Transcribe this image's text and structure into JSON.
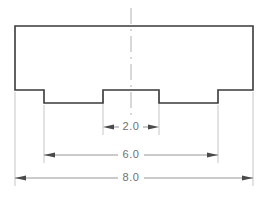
{
  "drawing": {
    "title": "Stepped block front view with dimensions",
    "units_note": "",
    "colors": {
      "background": "#ffffff",
      "part_outline": "#3a3a3a",
      "dimension_line": "#8a8a8a",
      "extension_line": "#b8b8b8",
      "centerline": "#a8a8a8",
      "arrow_fill": "#4a4a4a",
      "text": "#707070"
    },
    "part": {
      "name": "stepped-block-profile",
      "outline_points": "15,26 253,26 253,90 218,90 218,103 159,103 159,90 103,90 103,103 44,103 44,90 15,90",
      "overall_width_px": 238,
      "overall_height_px": 77
    },
    "centerline": {
      "name": "vertical-centerline",
      "x": 131,
      "y_top": 8,
      "y_bottom": 118
    },
    "dimensions": [
      {
        "id": "dim-2-0",
        "label": "2.0",
        "value": 2.0,
        "measures": "central boss width",
        "line_y": 127,
        "x_start": 103,
        "x_end": 159,
        "arrow_direction": "outward",
        "text_x": 131,
        "text_y": 127
      },
      {
        "id": "dim-6-0",
        "label": "6.0",
        "value": 6.0,
        "measures": "distance between inner step faces",
        "line_y": 155,
        "x_start": 44,
        "x_end": 218,
        "arrow_direction": "inward",
        "text_x": 131,
        "text_y": 155
      },
      {
        "id": "dim-8-0",
        "label": "8.0",
        "value": 8.0,
        "measures": "overall width",
        "line_y": 178,
        "x_start": 15,
        "x_end": 253,
        "arrow_direction": "inward",
        "text_x": 131,
        "text_y": 178
      }
    ],
    "extension_lines": [
      {
        "id": "ext-left-outer",
        "x": 15,
        "y_top": 92,
        "y_bottom": 186
      },
      {
        "id": "ext-left-inner",
        "x": 44,
        "y_top": 105,
        "y_bottom": 163
      },
      {
        "id": "ext-boss-left",
        "x": 103,
        "y_top": 92,
        "y_bottom": 135
      },
      {
        "id": "ext-boss-right",
        "x": 159,
        "y_top": 92,
        "y_bottom": 135
      },
      {
        "id": "ext-right-inner",
        "x": 218,
        "y_top": 105,
        "y_bottom": 163
      },
      {
        "id": "ext-right-outer",
        "x": 253,
        "y_top": 92,
        "y_bottom": 186
      }
    ]
  }
}
